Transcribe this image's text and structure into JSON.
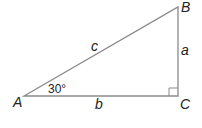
{
  "diagram": {
    "type": "right-triangle",
    "colors": {
      "stroke": "#8a8a8a",
      "text": "#222222",
      "background": "#ffffff"
    },
    "vertices": {
      "A": {
        "label": "A",
        "x": 24,
        "y": 96
      },
      "B": {
        "label": "B",
        "x": 178,
        "y": 7
      },
      "C": {
        "label": "C",
        "x": 178,
        "y": 96
      }
    },
    "sides": {
      "a": {
        "label": "a",
        "between": "B-C"
      },
      "b": {
        "label": "b",
        "between": "A-C"
      },
      "c": {
        "label": "c",
        "between": "A-B"
      }
    },
    "angle_A": {
      "label": "30°"
    },
    "right_angle_at": "C"
  }
}
